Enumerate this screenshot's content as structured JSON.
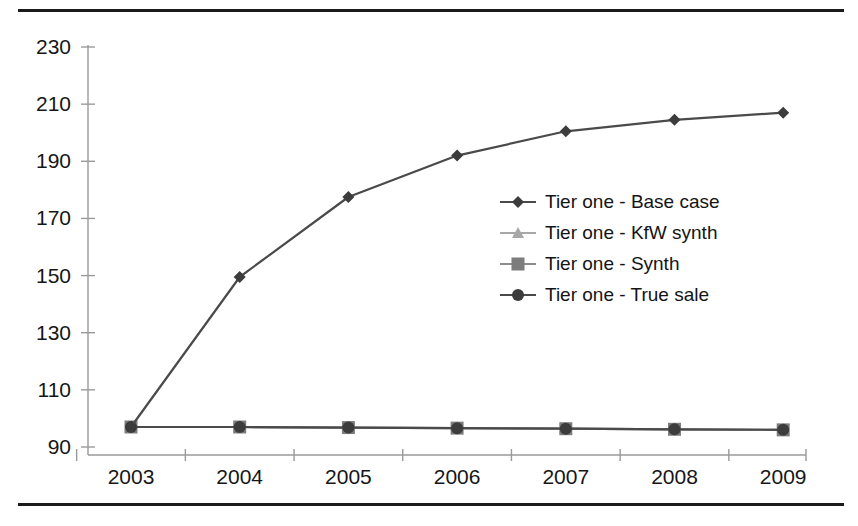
{
  "figure": {
    "has_top_rule": true,
    "has_bottom_rule": true,
    "rule_color": "#1b1b1b",
    "background": "#ffffff"
  },
  "chart_data": {
    "type": "line",
    "title": "",
    "subtitle": "",
    "xlabel": "",
    "ylabel": "",
    "categories": [
      "2003",
      "2004",
      "2005",
      "2006",
      "2007",
      "2008",
      "2009"
    ],
    "x": [
      2003,
      2004,
      2005,
      2006,
      2007,
      2008,
      2009
    ],
    "ylim": [
      90,
      230
    ],
    "yticks": [
      90,
      110,
      130,
      150,
      170,
      190,
      210,
      230
    ],
    "ytick_labels": [
      "90",
      "110",
      "130",
      "150",
      "170",
      "190",
      "210",
      "230"
    ],
    "xtick_labels": [
      "2003",
      "2004",
      "2005",
      "2006",
      "2007",
      "2008",
      "2009"
    ],
    "grid": false,
    "legend_position": "center-right",
    "series": [
      {
        "name": "Tier one - Base case",
        "marker": "diamond",
        "color": "#3c3c3c",
        "line_color": "#4a4a4a",
        "values": [
          97,
          149.5,
          177.5,
          192,
          200.5,
          204.5,
          207
        ]
      },
      {
        "name": "Tier one - KfW synth",
        "marker": "triangle",
        "color": "#a8a8a8",
        "line_color": "#a8a8a8",
        "values": [
          97,
          97,
          96.8,
          96.6,
          96.4,
          96.2,
          96
        ]
      },
      {
        "name": "Tier one - Synth",
        "marker": "square",
        "color": "#7d7d7d",
        "line_color": "#8c8c8c",
        "values": [
          97,
          97,
          96.8,
          96.6,
          96.4,
          96.2,
          96
        ]
      },
      {
        "name": "Tier one - True sale",
        "marker": "circle",
        "color": "#3c3c3c",
        "line_color": "#4a4a4a",
        "values": [
          97,
          97,
          96.8,
          96.6,
          96.4,
          96.2,
          96
        ]
      }
    ]
  }
}
